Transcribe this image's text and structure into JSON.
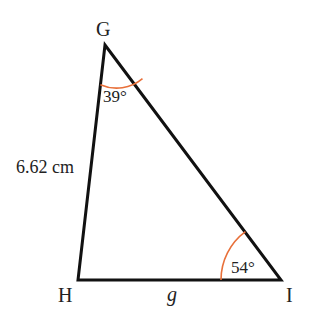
{
  "diagram": {
    "type": "triangle",
    "vertices": {
      "G": {
        "label": "G",
        "x": 105,
        "y": 45
      },
      "H": {
        "label": "H",
        "x": 78,
        "y": 280
      },
      "I": {
        "label": "I",
        "x": 281,
        "y": 280
      }
    },
    "sides": {
      "GH": {
        "label": "6.62 cm"
      },
      "HI": {
        "label": "g"
      }
    },
    "angles": {
      "G": {
        "label": "39°",
        "color": "#e8703a"
      },
      "I": {
        "label": "54°",
        "color": "#e8703a"
      }
    },
    "colors": {
      "stroke": "#111111",
      "arc": "#e8703a"
    }
  }
}
